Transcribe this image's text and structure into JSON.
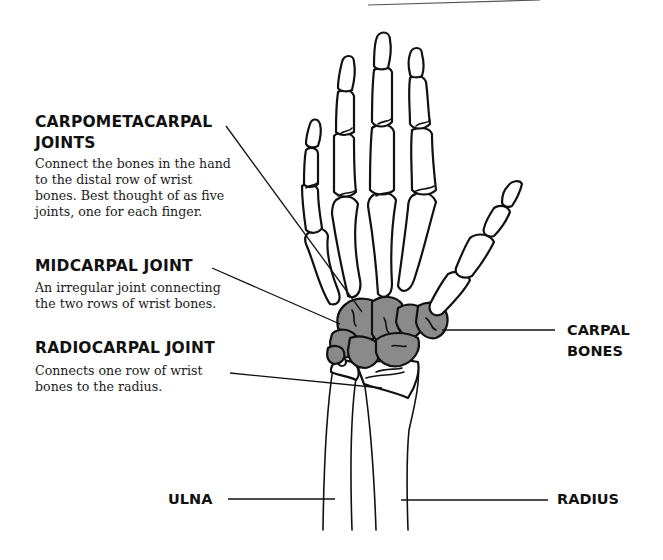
{
  "diagram": {
    "colors": {
      "carpal_fill": "#8a8a8a",
      "outline": "#111111",
      "background": "#ffffff"
    },
    "callouts": {
      "carpometacarpal": {
        "title_line1": "CARPOMETACARPAL",
        "title_line2": "JOINTS",
        "desc_line1": "Connect the bones in the hand",
        "desc_line2": "to the distal row of wrist",
        "desc_line3": "bones. Best thought of as five",
        "desc_line4": "joints, one for each finger."
      },
      "midcarpal": {
        "title": "MIDCARPAL JOINT",
        "desc_line1": "An irregular joint connecting",
        "desc_line2": "the two rows of wrist bones."
      },
      "radiocarpal": {
        "title": "RADIOCARPAL JOINT",
        "desc_line1": "Connects one row of wrist",
        "desc_line2": "bones to the radius."
      }
    },
    "labels": {
      "carpal_line1": "CARPAL",
      "carpal_line2": "BONES",
      "ulna": "ULNA",
      "radius": "RADIUS"
    }
  }
}
